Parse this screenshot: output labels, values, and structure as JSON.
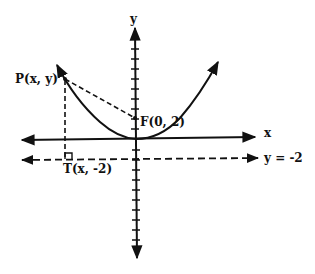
{
  "diagram": {
    "type": "parabola-focus-directrix",
    "labels": {
      "y_axis": "y",
      "x_axis": "x",
      "point_p": "P(x, y)",
      "focus": "F(0, 2)",
      "foot_t": "T(x, -2)",
      "directrix": "y = -2"
    },
    "colors": {
      "ink": "#111111",
      "background": "#ffffff"
    }
  }
}
